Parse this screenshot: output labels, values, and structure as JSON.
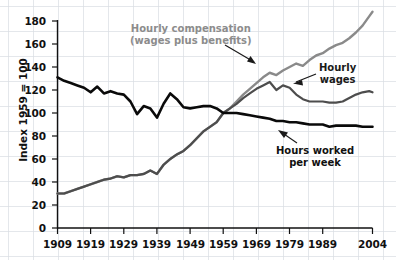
{
  "chart_data": {
    "type": "line",
    "title": "",
    "xlabel": "",
    "ylabel": "Index 1959 = 100",
    "xlim": [
      1909,
      2004
    ],
    "ylim": [
      0,
      190
    ],
    "grid": true,
    "legend_position": "inline-annotations",
    "x_ticks": [
      "1909",
      "1919",
      "1929",
      "1939",
      "1949",
      "1959",
      "1969",
      "1979",
      "1989",
      "2004"
    ],
    "y_ticks": [
      "0",
      "20",
      "40",
      "60",
      "80",
      "100",
      "120",
      "140",
      "160",
      "180"
    ],
    "annotations": [
      {
        "name": "hourly-compensation",
        "line1": "Hourly compensation",
        "line2": "(wages plus benefits)",
        "color": "#8c8c8c"
      },
      {
        "name": "hourly-wages",
        "line1": "Hourly",
        "line2": "wages",
        "color": "#1a1a1a"
      },
      {
        "name": "hours-worked",
        "line1": "Hours worked",
        "line2": "per week",
        "color": "#111111"
      }
    ],
    "series": [
      {
        "name": "Hourly compensation (wages plus benefits)",
        "color": "#8a8a8a",
        "width": 2.4,
        "x": [
          1909,
          1911,
          1913,
          1915,
          1917,
          1919,
          1921,
          1923,
          1925,
          1927,
          1929,
          1931,
          1933,
          1935,
          1937,
          1939,
          1941,
          1943,
          1945,
          1947,
          1949,
          1951,
          1953,
          1955,
          1957,
          1959,
          1961,
          1963,
          1965,
          1967,
          1969,
          1971,
          1973,
          1975,
          1977,
          1979,
          1981,
          1983,
          1985,
          1987,
          1989,
          1991,
          1993,
          1995,
          1997,
          1999,
          2001,
          2003,
          2004
        ],
        "values": [
          30,
          30,
          32,
          34,
          36,
          38,
          40,
          42,
          43,
          45,
          44,
          46,
          46,
          47,
          50,
          47,
          55,
          60,
          64,
          67,
          72,
          78,
          84,
          88,
          92,
          100,
          104,
          110,
          116,
          121,
          126,
          131,
          135,
          133,
          137,
          140,
          143,
          141,
          146,
          150,
          152,
          156,
          159,
          161,
          165,
          170,
          176,
          184,
          188
        ]
      },
      {
        "name": "Hourly wages",
        "color": "#4d4d4d",
        "width": 2.2,
        "x": [
          1909,
          1911,
          1913,
          1915,
          1917,
          1919,
          1921,
          1923,
          1925,
          1927,
          1929,
          1931,
          1933,
          1935,
          1937,
          1939,
          1941,
          1943,
          1945,
          1947,
          1949,
          1951,
          1953,
          1955,
          1957,
          1959,
          1961,
          1963,
          1965,
          1967,
          1969,
          1971,
          1973,
          1975,
          1977,
          1979,
          1981,
          1983,
          1985,
          1987,
          1989,
          1991,
          1993,
          1995,
          1997,
          1999,
          2001,
          2003,
          2004
        ],
        "values": [
          30,
          30,
          32,
          34,
          36,
          38,
          40,
          42,
          43,
          45,
          44,
          46,
          46,
          47,
          50,
          47,
          55,
          60,
          64,
          67,
          72,
          78,
          84,
          88,
          92,
          100,
          104,
          108,
          113,
          117,
          121,
          124,
          127,
          120,
          124,
          122,
          116,
          112,
          110,
          110,
          110,
          109,
          109,
          110,
          113,
          116,
          118,
          119,
          118
        ]
      },
      {
        "name": "Hours worked per week",
        "color": "#0a0a0a",
        "width": 2.6,
        "x": [
          1909,
          1911,
          1913,
          1915,
          1917,
          1919,
          1921,
          1923,
          1925,
          1927,
          1929,
          1931,
          1933,
          1935,
          1937,
          1939,
          1941,
          1943,
          1945,
          1947,
          1949,
          1951,
          1953,
          1955,
          1957,
          1959,
          1961,
          1963,
          1965,
          1967,
          1969,
          1971,
          1973,
          1975,
          1977,
          1979,
          1981,
          1983,
          1985,
          1987,
          1989,
          1991,
          1993,
          1995,
          1997,
          1999,
          2001,
          2003,
          2004
        ],
        "values": [
          131,
          128,
          126,
          124,
          122,
          118,
          123,
          117,
          119,
          117,
          116,
          110,
          99,
          106,
          104,
          96,
          108,
          117,
          112,
          105,
          104,
          105,
          106,
          106,
          104,
          100,
          100,
          100,
          99,
          98,
          97,
          96,
          95,
          93,
          93,
          92,
          92,
          91,
          90,
          90,
          90,
          88,
          89,
          89,
          89,
          89,
          88,
          88,
          88
        ]
      }
    ]
  }
}
